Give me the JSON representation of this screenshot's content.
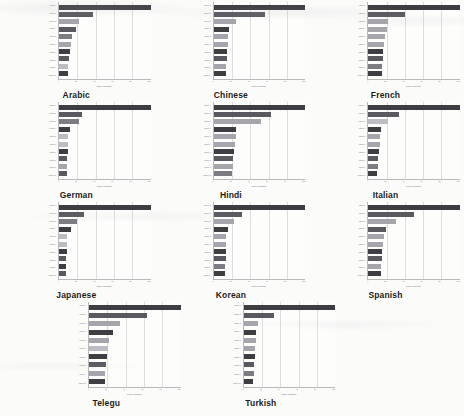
{
  "figure": {
    "background_color": "#fbfbfa",
    "panel_count": 11,
    "bars_per_panel": 10
  },
  "axis": {
    "xlabel": "relative importance",
    "tick_labels": [
      "0",
      "20",
      "40",
      "60",
      "80",
      "100"
    ]
  },
  "palette": {
    "dark": "#3d3d42",
    "mid_dark": "#59595f",
    "mid": "#7c7c82",
    "light": "#a5a5ab",
    "lighter": "#bcbcc2",
    "gridline": "#dedee1",
    "axis": "#b9b9bc",
    "plot_bg": "#fdfdfc"
  },
  "chart_data": [
    {
      "type": "bar",
      "orientation": "horizontal",
      "title": "Arabic",
      "xlabel": "relative importance",
      "ylabel": "",
      "xlim": [
        0,
        100
      ],
      "grid": true,
      "categories": [
        "feature 1",
        "feature 2",
        "feature 3",
        "feature 4",
        "feature 5",
        "feature 6",
        "feature 7",
        "feature 8",
        "feature 9",
        "feature 10"
      ],
      "values": [
        100,
        37,
        22,
        19,
        14,
        13,
        12,
        11,
        10,
        10
      ],
      "colors": [
        "#3d3d42",
        "#59595f",
        "#a5a5ab",
        "#59595f",
        "#7c7c82",
        "#a5a5ab",
        "#3d3d42",
        "#59595f",
        "#bcbcc2",
        "#3d3d42"
      ]
    },
    {
      "type": "bar",
      "orientation": "horizontal",
      "title": "Chinese",
      "xlabel": "relative importance",
      "ylabel": "",
      "xlim": [
        0,
        100
      ],
      "grid": true,
      "categories": [
        "feature 1",
        "feature 2",
        "feature 3",
        "feature 4",
        "feature 5",
        "feature 6",
        "feature 7",
        "feature 8",
        "feature 9",
        "feature 10"
      ],
      "values": [
        100,
        56,
        25,
        17,
        16,
        16,
        15,
        15,
        14,
        13
      ],
      "colors": [
        "#3d3d42",
        "#59595f",
        "#a5a5ab",
        "#3d3d42",
        "#a5a5ab",
        "#a5a5ab",
        "#3d3d42",
        "#59595f",
        "#a5a5ab",
        "#3d3d42"
      ]
    },
    {
      "type": "bar",
      "orientation": "horizontal",
      "title": "French",
      "xlabel": "relative importance",
      "ylabel": "",
      "xlim": [
        0,
        100
      ],
      "grid": true,
      "categories": [
        "feature 1",
        "feature 2",
        "feature 3",
        "feature 4",
        "feature 5",
        "feature 6",
        "feature 7",
        "feature 8",
        "feature 9",
        "feature 10"
      ],
      "values": [
        100,
        40,
        22,
        20,
        18,
        17,
        16,
        16,
        15,
        15
      ],
      "colors": [
        "#3d3d42",
        "#59595f",
        "#a5a5ab",
        "#a5a5ab",
        "#a5a5ab",
        "#a5a5ab",
        "#3d3d42",
        "#59595f",
        "#7c7c82",
        "#3d3d42"
      ]
    },
    {
      "type": "bar",
      "orientation": "horizontal",
      "title": "German",
      "xlabel": "relative importance",
      "ylabel": "",
      "xlim": [
        0,
        100
      ],
      "grid": true,
      "categories": [
        "feature 1",
        "feature 2",
        "feature 3",
        "feature 4",
        "feature 5",
        "feature 6",
        "feature 7",
        "feature 8",
        "feature 9",
        "feature 10"
      ],
      "values": [
        100,
        25,
        22,
        12,
        10,
        10,
        10,
        9,
        9,
        9
      ],
      "colors": [
        "#3d3d42",
        "#59595f",
        "#7c7c82",
        "#3d3d42",
        "#bcbcc2",
        "#bcbcc2",
        "#3d3d42",
        "#59595f",
        "#a5a5ab",
        "#59595f"
      ]
    },
    {
      "type": "bar",
      "orientation": "horizontal",
      "title": "Hindi",
      "xlabel": "relative importance",
      "ylabel": "",
      "xlim": [
        0,
        100
      ],
      "grid": true,
      "categories": [
        "feature 1",
        "feature 2",
        "feature 3",
        "feature 4",
        "feature 5",
        "feature 6",
        "feature 7",
        "feature 8",
        "feature 9",
        "feature 10"
      ],
      "values": [
        100,
        63,
        52,
        25,
        24,
        23,
        22,
        21,
        21,
        20
      ],
      "colors": [
        "#3d3d42",
        "#59595f",
        "#a5a5ab",
        "#3d3d42",
        "#a5a5ab",
        "#a5a5ab",
        "#3d3d42",
        "#59595f",
        "#a5a5ab",
        "#7c7c82"
      ]
    },
    {
      "type": "bar",
      "orientation": "horizontal",
      "title": "Italian",
      "xlabel": "relative importance",
      "ylabel": "",
      "xlim": [
        0,
        100
      ],
      "grid": true,
      "categories": [
        "feature 1",
        "feature 2",
        "feature 3",
        "feature 4",
        "feature 5",
        "feature 6",
        "feature 7",
        "feature 8",
        "feature 9",
        "feature 10"
      ],
      "values": [
        100,
        34,
        22,
        14,
        13,
        13,
        12,
        11,
        11,
        10
      ],
      "colors": [
        "#3d3d42",
        "#59595f",
        "#bcbcc2",
        "#3d3d42",
        "#a5a5ab",
        "#a5a5ab",
        "#3d3d42",
        "#59595f",
        "#7c7c82",
        "#3d3d42"
      ]
    },
    {
      "type": "bar",
      "orientation": "horizontal",
      "title": "Japanese",
      "xlabel": "relative importance",
      "ylabel": "",
      "xlim": [
        0,
        100
      ],
      "grid": true,
      "categories": [
        "feature 1",
        "feature 2",
        "feature 3",
        "feature 4",
        "feature 5",
        "feature 6",
        "feature 7",
        "feature 8",
        "feature 9",
        "feature 10"
      ],
      "values": [
        100,
        27,
        20,
        13,
        9,
        9,
        9,
        8,
        8,
        8
      ],
      "colors": [
        "#3d3d42",
        "#59595f",
        "#7c7c82",
        "#3d3d42",
        "#bcbcc2",
        "#bcbcc2",
        "#3d3d42",
        "#59595f",
        "#3d3d42",
        "#59595f"
      ]
    },
    {
      "type": "bar",
      "orientation": "horizontal",
      "title": "Korean",
      "xlabel": "relative importance",
      "ylabel": "",
      "xlim": [
        0,
        100
      ],
      "grid": true,
      "categories": [
        "feature 1",
        "feature 2",
        "feature 3",
        "feature 4",
        "feature 5",
        "feature 6",
        "feature 7",
        "feature 8",
        "feature 9",
        "feature 10"
      ],
      "values": [
        100,
        31,
        22,
        16,
        14,
        14,
        13,
        13,
        12,
        12
      ],
      "colors": [
        "#3d3d42",
        "#59595f",
        "#a5a5ab",
        "#3d3d42",
        "#a5a5ab",
        "#a5a5ab",
        "#3d3d42",
        "#59595f",
        "#7c7c82",
        "#3d3d42"
      ]
    },
    {
      "type": "bar",
      "orientation": "horizontal",
      "title": "Spanish",
      "xlabel": "relative importance",
      "ylabel": "",
      "xlim": [
        0,
        100
      ],
      "grid": true,
      "categories": [
        "feature 1",
        "feature 2",
        "feature 3",
        "feature 4",
        "feature 5",
        "feature 6",
        "feature 7",
        "feature 8",
        "feature 9",
        "feature 10"
      ],
      "values": [
        100,
        50,
        30,
        19,
        17,
        16,
        15,
        15,
        14,
        14
      ],
      "colors": [
        "#3d3d42",
        "#59595f",
        "#a5a5ab",
        "#59595f",
        "#a5a5ab",
        "#a5a5ab",
        "#3d3d42",
        "#59595f",
        "#a5a5ab",
        "#3d3d42"
      ]
    },
    {
      "type": "bar",
      "orientation": "horizontal",
      "title": "Telegu",
      "xlabel": "relative importance",
      "ylabel": "",
      "xlim": [
        0,
        100
      ],
      "grid": true,
      "categories": [
        "feature 1",
        "feature 2",
        "feature 3",
        "feature 4",
        "feature 5",
        "feature 6",
        "feature 7",
        "feature 8",
        "feature 9",
        "feature 10"
      ],
      "values": [
        100,
        63,
        34,
        26,
        22,
        21,
        20,
        19,
        18,
        18
      ],
      "colors": [
        "#3d3d42",
        "#59595f",
        "#a5a5ab",
        "#3d3d42",
        "#a5a5ab",
        "#bcbcc2",
        "#3d3d42",
        "#59595f",
        "#a5a5ab",
        "#3d3d42"
      ]
    },
    {
      "type": "bar",
      "orientation": "horizontal",
      "title": "Turkish",
      "xlabel": "relative importance",
      "ylabel": "",
      "xlim": [
        0,
        100
      ],
      "grid": true,
      "categories": [
        "feature 1",
        "feature 2",
        "feature 3",
        "feature 4",
        "feature 5",
        "feature 6",
        "feature 7",
        "feature 8",
        "feature 9",
        "feature 10"
      ],
      "values": [
        100,
        33,
        16,
        14,
        13,
        12,
        12,
        11,
        11,
        10
      ],
      "colors": [
        "#3d3d42",
        "#59595f",
        "#a5a5ab",
        "#3d3d42",
        "#a5a5ab",
        "#a5a5ab",
        "#3d3d42",
        "#59595f",
        "#7c7c82",
        "#3d3d42"
      ]
    }
  ]
}
